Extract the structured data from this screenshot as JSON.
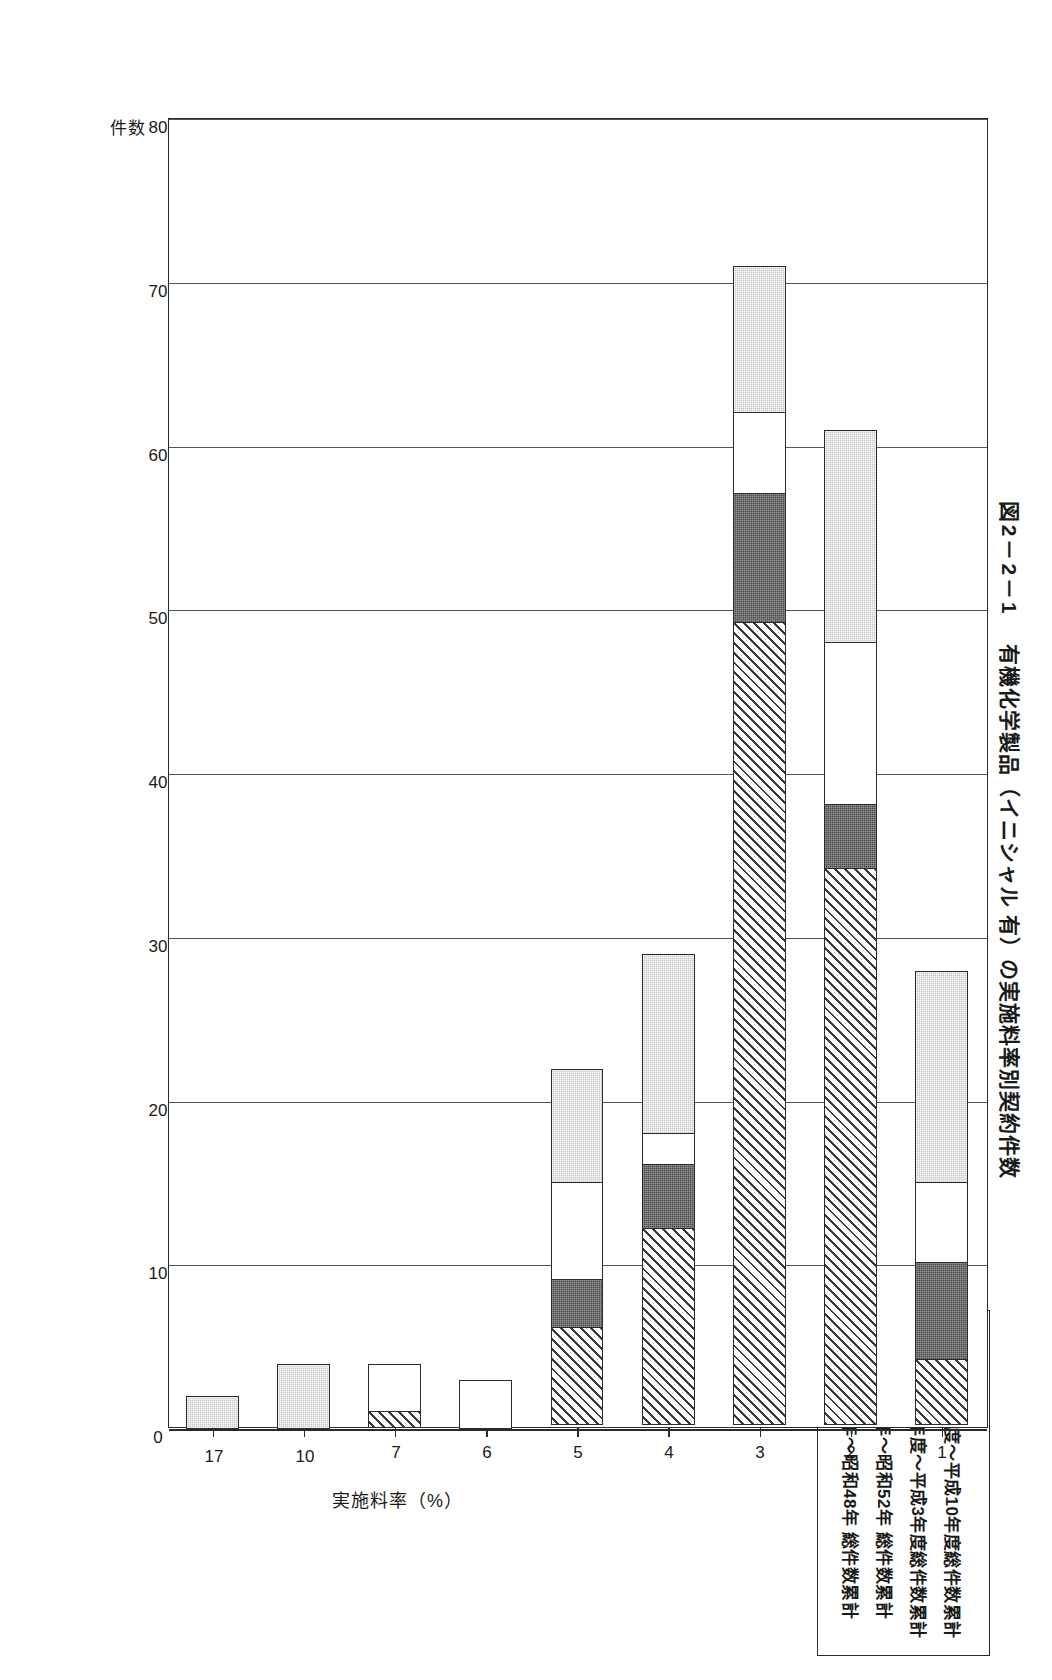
{
  "figure": {
    "number": "図2－2－1",
    "title": "有機化学製品（イニシャル 有）の実施料率別契約件数"
  },
  "legend": {
    "items": [
      {
        "swatch": "light-gray-dotted",
        "label": "平成4年度～平成10年度総件数累計"
      },
      {
        "swatch": "white",
        "label": "昭和63年度～平成3年度総件数累計"
      },
      {
        "swatch": "dark-gray",
        "label": "昭和49年～昭和52年 総件数累計"
      },
      {
        "swatch": "diagonal-hatch",
        "label": "昭和43年～昭和48年 総件数累計"
      }
    ]
  },
  "axes": {
    "value_axis_title": "件数",
    "category_axis_title": "実施料率（%）",
    "value_ticks": [
      "0",
      "10",
      "20",
      "30",
      "40",
      "50",
      "60",
      "70",
      "80"
    ],
    "category_ticks": [
      "1",
      "2",
      "3",
      "4",
      "5",
      "6",
      "7",
      "10",
      "17"
    ]
  },
  "chart_data": {
    "type": "bar",
    "orientation": "horizontal-stacked",
    "title": "図2－2－1 有機化学製品（イニシャル 有）の実施料率別契約件数",
    "xlabel": "実施料率（%）",
    "ylabel": "件数",
    "ylim": [
      0,
      80
    ],
    "grid": true,
    "legend_position": "top-right",
    "categories": [
      "1",
      "2",
      "3",
      "4",
      "5",
      "6",
      "7",
      "10",
      "17"
    ],
    "series": [
      {
        "name": "昭和43年～昭和48年 総件数累計",
        "fill": "diagonal-hatch",
        "values": [
          4,
          34,
          49,
          12,
          6,
          0,
          1,
          0,
          0
        ]
      },
      {
        "name": "昭和49年～昭和52年 総件数累計",
        "fill": "dark-gray",
        "values": [
          6,
          4,
          8,
          4,
          3,
          0,
          0,
          0,
          0
        ]
      },
      {
        "name": "昭和63年度～平成3年度総件数累計",
        "fill": "white",
        "values": [
          5,
          10,
          5,
          2,
          6,
          3,
          3,
          0,
          0
        ]
      },
      {
        "name": "平成4年度～平成10年度総件数累計",
        "fill": "light-gray-dotted",
        "values": [
          13,
          13,
          9,
          11,
          7,
          0,
          0,
          4,
          2
        ]
      }
    ],
    "totals": [
      28,
      61,
      71,
      29,
      22,
      3,
      4,
      4,
      2
    ]
  }
}
